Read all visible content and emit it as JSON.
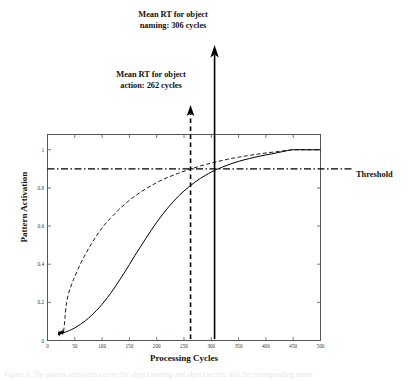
{
  "figure": {
    "background": "#ffffff",
    "ink_color": "#000000"
  },
  "annotations": {
    "naming": {
      "line1": "Mean RT for object",
      "line2": "naming: 306 cycles",
      "value": 306,
      "line_style": "solid",
      "arrow": "up"
    },
    "action": {
      "line1": "Mean RT for object",
      "line2": "action: 262 cycles",
      "value": 262,
      "line_style": "dashed",
      "arrow": "up"
    },
    "threshold": {
      "label": "Threshold",
      "value": 0.9,
      "line_style": "dash-dot"
    }
  },
  "caption": {
    "text": "Figure 3.  The pattern activation curves for object naming and object action, and the corresponding mean"
  },
  "chart_data": {
    "type": "line",
    "title": "",
    "xlabel": "Processing Cycles",
    "ylabel": "Pattern Activation",
    "xlim": [
      0,
      500
    ],
    "ylim": [
      0,
      1.08
    ],
    "xticks": [
      0,
      50,
      100,
      150,
      200,
      250,
      300,
      350,
      400,
      450,
      500
    ],
    "xtick_labels": [
      "0",
      "50",
      "100",
      "150",
      "200",
      "250",
      "300",
      "350",
      "400",
      "450",
      "500"
    ],
    "yticks": [
      0,
      0.2,
      0.4,
      0.6,
      0.8,
      1
    ],
    "ytick_labels": [
      "0",
      "0.2",
      "0.4",
      "0.6",
      "0.8",
      "1"
    ],
    "grid": false,
    "legend": "none",
    "box": true,
    "series": [
      {
        "name": "object action",
        "style": "dashed",
        "color": "#000000",
        "x": [
          20,
          22,
          24,
          26,
          28,
          30,
          32,
          35,
          40,
          45,
          50,
          60,
          70,
          80,
          90,
          100,
          110,
          120,
          130,
          140,
          150,
          160,
          170,
          180,
          190,
          200,
          210,
          220,
          230,
          240,
          250,
          262,
          270,
          280,
          290,
          300,
          310,
          320,
          330,
          340,
          350,
          360,
          380,
          400,
          420,
          440,
          450,
          470,
          500
        ],
        "y": [
          0.03,
          0.032,
          0.035,
          0.037,
          0.04,
          0.06,
          0.12,
          0.2,
          0.26,
          0.3,
          0.335,
          0.4,
          0.455,
          0.505,
          0.55,
          0.59,
          0.625,
          0.655,
          0.685,
          0.71,
          0.735,
          0.757,
          0.777,
          0.795,
          0.812,
          0.828,
          0.842,
          0.855,
          0.866,
          0.877,
          0.887,
          0.9,
          0.906,
          0.915,
          0.923,
          0.93,
          0.937,
          0.944,
          0.95,
          0.956,
          0.961,
          0.966,
          0.975,
          0.983,
          0.99,
          0.997,
          1.0,
          1.0,
          1.0
        ]
      },
      {
        "name": "object naming",
        "style": "solid",
        "color": "#000000",
        "x": [
          20,
          22,
          24,
          26,
          28,
          30,
          35,
          40,
          50,
          60,
          70,
          80,
          90,
          100,
          110,
          120,
          130,
          140,
          150,
          160,
          170,
          180,
          190,
          200,
          210,
          220,
          230,
          240,
          250,
          260,
          270,
          280,
          290,
          300,
          306,
          310,
          320,
          330,
          340,
          350,
          360,
          370,
          380,
          390,
          400,
          410,
          420,
          430,
          440,
          450,
          470,
          500
        ],
        "y": [
          0.03,
          0.033,
          0.036,
          0.038,
          0.04,
          0.042,
          0.046,
          0.052,
          0.066,
          0.084,
          0.105,
          0.13,
          0.158,
          0.19,
          0.226,
          0.265,
          0.308,
          0.352,
          0.398,
          0.445,
          0.49,
          0.535,
          0.578,
          0.62,
          0.658,
          0.694,
          0.727,
          0.757,
          0.784,
          0.808,
          0.83,
          0.85,
          0.867,
          0.883,
          0.892,
          0.897,
          0.909,
          0.92,
          0.93,
          0.939,
          0.947,
          0.954,
          0.961,
          0.967,
          0.973,
          0.978,
          0.984,
          0.99,
          0.996,
          1.0,
          1.0,
          1.0
        ]
      }
    ],
    "vertical_markers": [
      {
        "name": "object action",
        "x": 262,
        "style": "dashed",
        "arrow_top_label": "Mean RT for object action: 262 cycles"
      },
      {
        "name": "object naming",
        "x": 306,
        "style": "solid",
        "arrow_top_label": "Mean RT for object naming: 306 cycles"
      }
    ],
    "horizontal_markers": [
      {
        "name": "threshold",
        "y": 0.9,
        "style": "dash-dot",
        "label": "Threshold"
      }
    ]
  }
}
